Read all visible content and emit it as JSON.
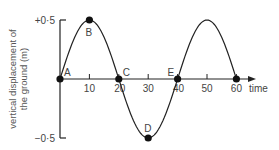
{
  "chart_data": {
    "type": "line",
    "title": "",
    "xlabel": "time",
    "ylabel": "vertical displacement of the ground (m)",
    "ylabel_lines": [
      "vertical displacement of",
      "the ground (m)"
    ],
    "xlim": [
      0,
      65
    ],
    "ylim": [
      -0.5,
      0.5
    ],
    "x_ticks": [
      10,
      20,
      30,
      40,
      50,
      60
    ],
    "x_tick_labels": [
      "10",
      "20",
      "30",
      "40",
      "50",
      "60"
    ],
    "y_ticks": [
      0.5,
      -0.5
    ],
    "y_tick_labels": [
      "+0·5",
      "−0·5"
    ],
    "grid": false,
    "series": [
      {
        "name": "displacement",
        "x": [
          0,
          5,
          10,
          15,
          20,
          25,
          30,
          35,
          40,
          45,
          50,
          55,
          60
        ],
        "values": [
          0,
          0.35,
          0.5,
          0.35,
          0,
          -0.35,
          -0.5,
          -0.35,
          0,
          0.35,
          0.5,
          0.35,
          0
        ]
      }
    ],
    "points": [
      {
        "label": "A",
        "x": 0,
        "y": 0
      },
      {
        "label": "B",
        "x": 10,
        "y": 0.5
      },
      {
        "label": "C",
        "x": 20,
        "y": 0
      },
      {
        "label": "D",
        "x": 30,
        "y": -0.5
      },
      {
        "label": "E",
        "x": 40,
        "y": 0
      },
      {
        "label": "",
        "x": 60,
        "y": 0
      }
    ]
  }
}
